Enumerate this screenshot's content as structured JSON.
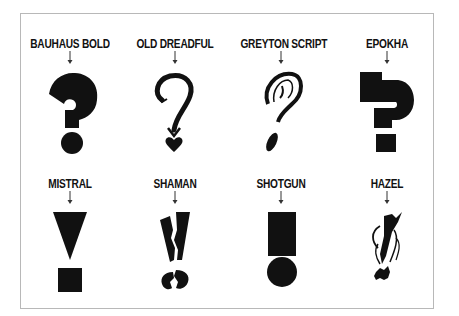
{
  "page": {
    "background": "#ffffff",
    "frame_border_color": "#b8b8b8",
    "ink_color": "#111111"
  },
  "rows": [
    {
      "glyph_type": "question-mark",
      "items": [
        {
          "label": "BAUHAUS BOLD",
          "glyph": "bauhaus-question-mark"
        },
        {
          "label": "OLD DREADFUL",
          "glyph": "old-dreadful-question-mark"
        },
        {
          "label": "GREYTON SCRIPT",
          "glyph": "greyton-script-question-mark"
        },
        {
          "label": "EPOKHA",
          "glyph": "epokha-question-mark"
        }
      ]
    },
    {
      "glyph_type": "exclamation-mark",
      "items": [
        {
          "label": "MISTRAL",
          "glyph": "mistral-exclamation-mark"
        },
        {
          "label": "SHAMAN",
          "glyph": "shaman-exclamation-mark"
        },
        {
          "label": "SHOTGUN",
          "glyph": "shotgun-exclamation-mark"
        },
        {
          "label": "HAZEL",
          "glyph": "hazel-exclamation-mark"
        }
      ]
    }
  ]
}
